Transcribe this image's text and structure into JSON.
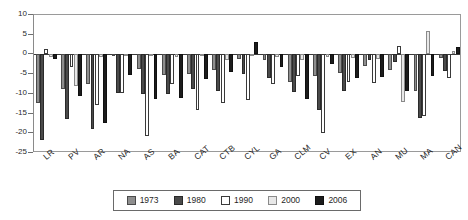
{
  "chart_data": {
    "type": "bar",
    "title": "",
    "subtitle": "",
    "xlabel": "",
    "ylabel": "",
    "ylim": [
      -25,
      10
    ],
    "ytick_step": 5,
    "yticks": [
      10,
      5,
      0,
      -5,
      -10,
      -15,
      -20,
      -25
    ],
    "grid": false,
    "legend_position": "bottom",
    "categories": [
      "LR",
      "PV",
      "AR",
      "NA",
      "AS",
      "BA",
      "CAT",
      "CTB",
      "CYL",
      "GA",
      "CLM",
      "CV",
      "EX",
      "AN",
      "MU",
      "MA",
      "CAN"
    ],
    "series": [
      {
        "name": "1973",
        "color": "#8e8e8e",
        "values": [
          -12.3,
          -8.8,
          -7.6,
          -0.4,
          -3.6,
          -5.2,
          -5.0,
          -3.9,
          -1.2,
          -1.3,
          -7.0,
          -5.5,
          -4.6,
          -3.0,
          -4.0,
          -9.3,
          -1.0
        ]
      },
      {
        "name": "1980",
        "color": "#4a4a4a",
        "values": [
          -21.8,
          -16.3,
          -18.9,
          -9.8,
          -10.0,
          -10.0,
          -8.7,
          -9.2,
          -5.0,
          -6.0,
          -9.6,
          -14.0,
          -9.4,
          -1.4,
          -2.0,
          -16.1,
          -4.2
        ]
      },
      {
        "name": "1990",
        "color": "#ffffff",
        "values": [
          1.3,
          -3.3,
          -12.8,
          -9.7,
          -20.6,
          -7.6,
          -14.0,
          -12.4,
          -11.6,
          -7.5,
          -5.4,
          -19.9,
          -6.9,
          -7.2,
          2.1,
          -15.6,
          -5.9
        ]
      },
      {
        "name": "2000",
        "color": "#e8e8e8",
        "values": [
          -0.6,
          -7.9,
          -0.6,
          -0.5,
          -0.3,
          -0.6,
          -0.5,
          -1.5,
          -0.4,
          -0.7,
          -1.5,
          -0.6,
          -0.9,
          -1.1,
          -12.0,
          5.9,
          0.9
        ]
      },
      {
        "name": "2006",
        "color": "#1c1c1c",
        "values": [
          -1.2,
          -10.6,
          -17.3,
          -5.3,
          -11.4,
          -11.0,
          -6.3,
          -4.5,
          3.1,
          -3.2,
          -11.3,
          -2.5,
          -6.1,
          -5.8,
          -9.4,
          -5.4,
          1.8
        ]
      }
    ]
  },
  "axis": {
    "y_tick_labels": [
      "10",
      "5",
      "0",
      "-5",
      "-10",
      "-15",
      "-20",
      "-25"
    ]
  },
  "legend": {
    "items": [
      {
        "label": "1973",
        "color": "#8e8e8e"
      },
      {
        "label": "1980",
        "color": "#4a4a4a"
      },
      {
        "label": "1990",
        "color": "#ffffff"
      },
      {
        "label": "2000",
        "color": "#e8e8e8"
      },
      {
        "label": "2006",
        "color": "#1c1c1c"
      }
    ]
  }
}
